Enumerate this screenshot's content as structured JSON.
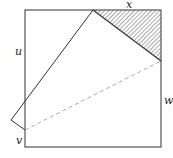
{
  "diagram": {
    "type": "folded-square",
    "labels": {
      "x": "x",
      "u": "u",
      "v": "v",
      "w": "w"
    },
    "colors": {
      "stroke": "#333333",
      "dashed": "#aaaaaa",
      "hatch": "#555555",
      "background": "#ffffff"
    }
  }
}
